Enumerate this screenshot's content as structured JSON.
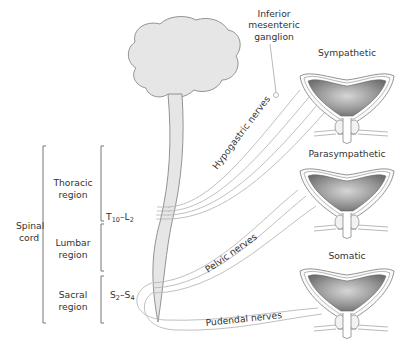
{
  "diagram": {
    "type": "anatomical-diagram",
    "topic": "Neural control of the bladder",
    "labels": {
      "spinal_cord": [
        "Spinal",
        "cord"
      ],
      "thoracic_region": [
        "Thoracic",
        "region"
      ],
      "lumbar_region": [
        "Lumbar",
        "region"
      ],
      "sacral_region": [
        "Sacral",
        "region"
      ],
      "segment_t10_l2": {
        "a": "T",
        "a_sub": "10",
        "dash": "–L",
        "b_sub": "2"
      },
      "segment_s2_s4": {
        "a": "S",
        "a_sub": "2",
        "dash": "–S",
        "b_sub": "4"
      },
      "inferior_mesenteric_ganglion": [
        "Inferior",
        "mesenteric",
        "ganglion"
      ],
      "hypogastric_nerves": "Hypogastric nerves",
      "pelvic_nerves": "Pelvic nerves",
      "pudendal_nerves": "Pudendal nerves"
    },
    "bladders": [
      {
        "title": "Sympathetic"
      },
      {
        "title": "Parasympathetic"
      },
      {
        "title": "Somatic"
      }
    ],
    "colors": {
      "brain_fill": "#e6e6e6",
      "outline": "#888888",
      "nerve": "#b8b8b8",
      "bladder_dark": "#6e6e6e",
      "bladder_light": "#c8c8c8",
      "text": "#333333"
    }
  }
}
